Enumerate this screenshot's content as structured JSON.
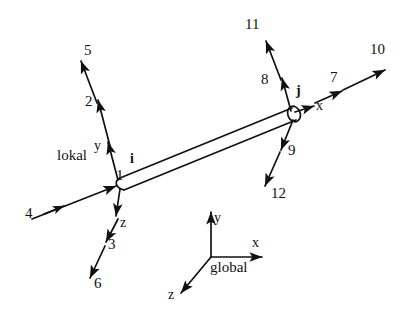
{
  "figure": {
    "background_color": "#ffffff",
    "line_color": "#111111"
  },
  "nodes": [
    {
      "id": "i",
      "label": "i",
      "x": 120,
      "y": 183
    },
    {
      "id": "j",
      "label": "j",
      "x": 293,
      "y": 113
    }
  ],
  "coordinate_systems": {
    "local": {
      "name": "lokal",
      "axes": [
        {
          "axis": "x",
          "label": "x"
        },
        {
          "axis": "y",
          "label": "y"
        },
        {
          "axis": "z",
          "label": "z"
        }
      ]
    },
    "global": {
      "name": "global",
      "axes": [
        {
          "axis": "x",
          "label": "x"
        },
        {
          "axis": "y",
          "label": "y"
        },
        {
          "axis": "z",
          "label": "z"
        }
      ]
    }
  },
  "dof_labels": {
    "node_i": {
      "translations": [
        "1",
        "2",
        "3"
      ],
      "rotations": [
        "4",
        "5",
        "6"
      ]
    },
    "node_j": {
      "translations": [
        "7",
        "8",
        "9"
      ],
      "rotations": [
        "10",
        "11",
        "12"
      ]
    }
  },
  "arrows": [
    {
      "name": "dof-1",
      "label": "1",
      "node": "i",
      "axis": "x",
      "kind": "translation"
    },
    {
      "name": "dof-2",
      "label": "2",
      "node": "i",
      "axis": "y",
      "kind": "translation"
    },
    {
      "name": "dof-3",
      "label": "3",
      "node": "i",
      "axis": "z",
      "kind": "translation"
    },
    {
      "name": "dof-4",
      "label": "4",
      "node": "i",
      "axis": "x",
      "kind": "rotation"
    },
    {
      "name": "dof-5",
      "label": "5",
      "node": "i",
      "axis": "y",
      "kind": "rotation"
    },
    {
      "name": "dof-6",
      "label": "6",
      "node": "i",
      "axis": "z",
      "kind": "rotation"
    },
    {
      "name": "dof-7",
      "label": "7",
      "node": "j",
      "axis": "x",
      "kind": "translation"
    },
    {
      "name": "dof-8",
      "label": "8",
      "node": "j",
      "axis": "y",
      "kind": "translation"
    },
    {
      "name": "dof-9",
      "label": "9",
      "node": "j",
      "axis": "z",
      "kind": "translation"
    },
    {
      "name": "dof-10",
      "label": "10",
      "node": "j",
      "axis": "x",
      "kind": "rotation"
    },
    {
      "name": "dof-11",
      "label": "11",
      "node": "j",
      "axis": "y",
      "kind": "rotation"
    },
    {
      "name": "dof-12",
      "label": "12",
      "node": "j",
      "axis": "z",
      "kind": "rotation"
    }
  ],
  "labels": {
    "n1": "1",
    "n2": "2",
    "n3": "3",
    "n4": "4",
    "n5": "5",
    "n6": "6",
    "n7": "7",
    "n8": "8",
    "n9": "9",
    "n10": "10",
    "n11": "11",
    "n12": "12",
    "node_i": "i",
    "node_j": "j",
    "local_name": "lokal",
    "local_x": "x",
    "local_y": "y",
    "local_z": "z",
    "global_name": "global",
    "global_x": "x",
    "global_y": "y",
    "global_z": "z"
  }
}
